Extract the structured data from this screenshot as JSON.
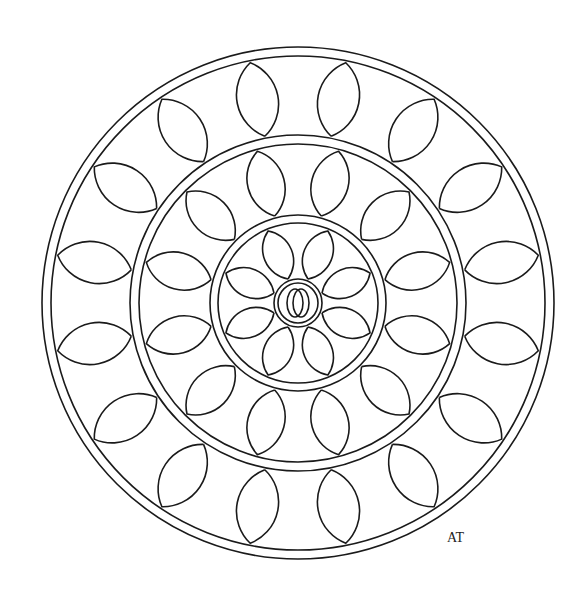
{
  "artwork": {
    "title": "Mandala coloring page",
    "signature": "AT",
    "stroke_color": "#1a1a1a",
    "background": "#ffffff",
    "center": [
      298,
      303
    ],
    "rings": [
      {
        "name": "outer",
        "r_outer": 256,
        "r_inner": 247,
        "petals": 16,
        "petal_radius": 52
      },
      {
        "name": "middle",
        "r_outer": 168,
        "r_inner": 159,
        "petals": 12,
        "petal_radius": 40
      },
      {
        "name": "inner",
        "r_outer": 88,
        "r_inner": 80,
        "petals": 8,
        "petal_radius": 32
      },
      {
        "name": "core",
        "r_outer": 24,
        "r_inner": 20,
        "petals": 0
      }
    ]
  }
}
